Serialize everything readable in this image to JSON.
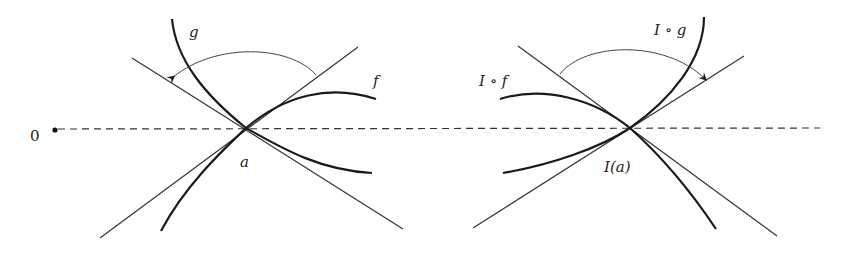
{
  "figure": {
    "colors": {
      "stroke": "#1a1a1a",
      "thin_stroke": "#333333",
      "background": "#ffffff"
    },
    "origin_label": "0",
    "baseline": "dashed",
    "left_panel": {
      "point_label": "a",
      "curve_labels": {
        "f": "f",
        "g": "g"
      },
      "arc_direction": "counterclockwise (arrow on left tangent)"
    },
    "right_panel": {
      "point_label": "I(a)",
      "curve_labels": {
        "f": "I ∘ f",
        "g": "I ∘ g"
      },
      "arc_direction": "clockwise (arrow on right tangent)"
    }
  }
}
